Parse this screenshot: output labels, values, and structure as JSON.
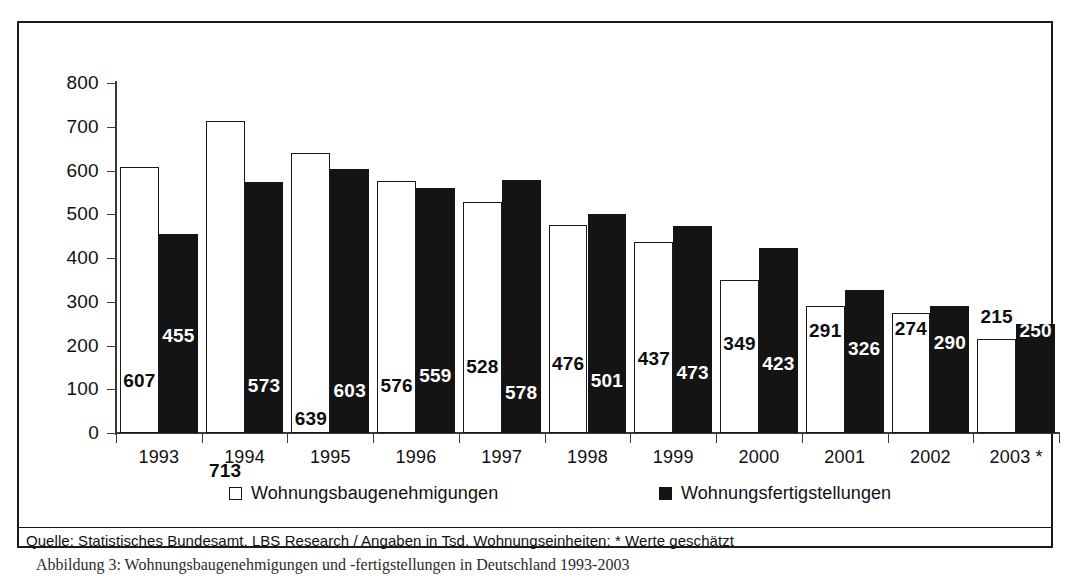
{
  "chart_data": {
    "type": "bar",
    "title": "",
    "xlabel": "",
    "ylabel": "",
    "ylim": [
      0,
      800
    ],
    "ytick_step": 100,
    "grid": false,
    "legend_position": "bottom",
    "categories": [
      "1993",
      "1994",
      "1995",
      "1996",
      "1997",
      "1998",
      "1999",
      "2000",
      "2001",
      "2002",
      "2003 *"
    ],
    "series": [
      {
        "name": "Wohnungsbaugenehmigungen",
        "style": "open",
        "values": [
          607,
          713,
          639,
          576,
          528,
          476,
          437,
          349,
          291,
          274,
          215
        ]
      },
      {
        "name": "Wohnungsfertigstellungen",
        "style": "solid",
        "values": [
          455,
          573,
          603,
          559,
          578,
          501,
          473,
          423,
          326,
          290,
          250
        ]
      }
    ],
    "ytick_labels": [
      "800",
      "700",
      "600",
      "500",
      "400",
      "300",
      "200",
      "100",
      "0"
    ],
    "annotation": "Quelle: Statistisches Bundesamt, LBS Research / Angaben in Tsd. Wohnungseinheiten; * Werte geschätzt"
  },
  "legend": {
    "items": [
      {
        "label": "Wohnungsbaugenehmigungen",
        "style": "open"
      },
      {
        "label": "Wohnungsfertigstellungen",
        "style": "solid"
      }
    ]
  },
  "source": {
    "text": "Quelle: Statistisches Bundesamt, LBS Research / Angaben in Tsd. Wohnungseinheiten; * Werte geschätzt"
  },
  "caption": {
    "text": "Abbildung 3: Wohnungsbaugenehmigungen und -fertigstellungen in Deutschland 1993-2003"
  },
  "colors": {
    "permits_fill": "#ffffff",
    "completions_fill": "#141414",
    "outline": "#1a1a1a",
    "axis": "#3a3a3a",
    "label_dark": "#0d0d0d",
    "label_light": "#ffffff"
  }
}
